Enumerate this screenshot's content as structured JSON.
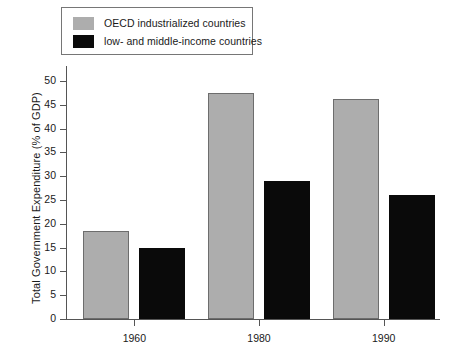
{
  "chart_data": {
    "type": "bar",
    "title": "",
    "xlabel": "",
    "ylabel": "Total Government Expenditure (% of GDP)",
    "categories": [
      "1960",
      "1980",
      "1990"
    ],
    "series": [
      {
        "name": "OECD industrialized countries",
        "color": "#adadad",
        "values": [
          18.5,
          47.5,
          46.3
        ]
      },
      {
        "name": "low- and middle-income countries",
        "color": "#0a0a0a",
        "values": [
          15.0,
          29.0,
          26.0
        ]
      }
    ],
    "ylim": [
      0,
      50
    ],
    "yticks": [
      0,
      5,
      10,
      15,
      20,
      25,
      30,
      35,
      40,
      45,
      50
    ],
    "ytick_labels": [
      "0",
      "5",
      "10",
      "15",
      "20",
      "25",
      "30",
      "35",
      "40",
      "45",
      "50"
    ],
    "grid": false,
    "legend_position": "top-left",
    "legend_boxed": true
  },
  "legend": {
    "entries": [
      {
        "label": "OECD industrialized countries",
        "swatch": "gray"
      },
      {
        "label": "low- and middle-income countries",
        "swatch": "black"
      }
    ]
  }
}
